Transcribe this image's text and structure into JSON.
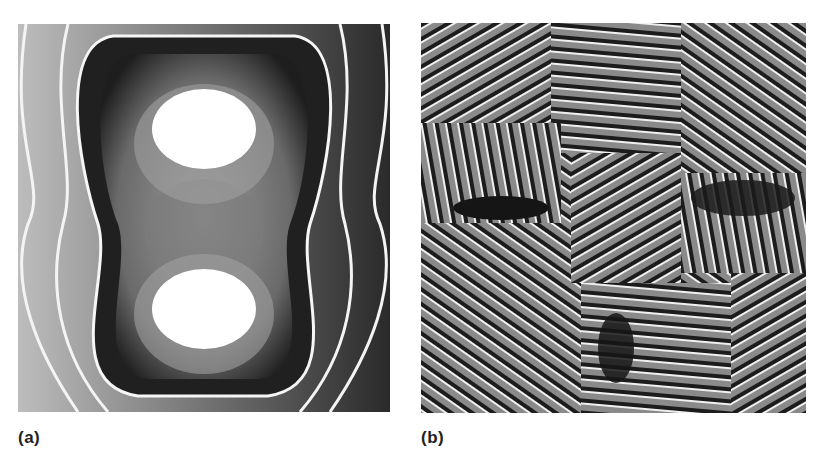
{
  "figure": {
    "panels": [
      {
        "id": "a",
        "label": "(a)",
        "description": "Wrapped phase map: concentric fringes around two white lobes (upper and lower) in a peanut-shaped contour, grayscale"
      },
      {
        "id": "b",
        "label": "(b)",
        "description": "Dense fringe pattern of short curved stripes radiating in a cross-like arrangement with dark elliptical patches, grayscale"
      }
    ],
    "colors": {
      "background": "#ffffff",
      "fringe_light": "#f2f2f2",
      "fringe_dark": "#1a1a1a",
      "label": "#222222"
    }
  }
}
